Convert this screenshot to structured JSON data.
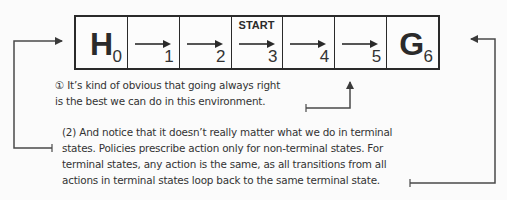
{
  "diagram": {
    "start_label": "START",
    "cells": [
      {
        "index": "0",
        "label": "H",
        "type": "terminal-hole",
        "action": null
      },
      {
        "index": "1",
        "label": "",
        "type": "state",
        "action": "right"
      },
      {
        "index": "2",
        "label": "",
        "type": "state",
        "action": "right"
      },
      {
        "index": "3",
        "label": "",
        "type": "start",
        "action": "right"
      },
      {
        "index": "4",
        "label": "",
        "type": "state",
        "action": "right"
      },
      {
        "index": "5",
        "label": "",
        "type": "state",
        "action": "right"
      },
      {
        "index": "6",
        "label": "G",
        "type": "terminal-goal",
        "action": null
      }
    ],
    "notes": [
      {
        "id": "1",
        "lines": [
          "① It’s kind of obvious that going always right",
          "is the best we can do in this environment."
        ]
      },
      {
        "id": "2",
        "lines": [
          "(2) And notice that it doesn’t really matter what we do in terminal",
          "states. Policies prescribe action only for non-terminal states. For",
          "terminal states, any action is the same, as all transitions from all",
          "actions in terminal states loop back to the same terminal state."
        ]
      }
    ],
    "colors": {
      "line": "#2a2a2a",
      "text": "#333333",
      "background": "#fbfbfb"
    }
  }
}
